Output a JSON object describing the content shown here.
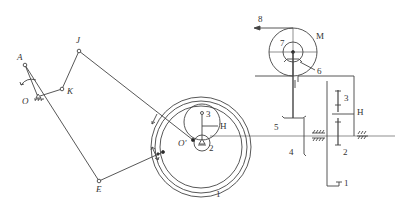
{
  "diagram": {
    "type": "mechanism-kinematic-sketch",
    "colors": {
      "line": "#444444",
      "text": "#333333",
      "background": "#ffffff"
    },
    "labels": {
      "A": "A",
      "O": "O",
      "K": "K",
      "J": "J",
      "E": "E",
      "O_prime": "O'",
      "gear_1": "1",
      "gear_2": "2",
      "gear_3": "3",
      "carrier_H": "H",
      "gear_4": "4",
      "gear_5": "5",
      "part_6": "6",
      "pulley_7": "7",
      "belt_8": "8",
      "motor_M": "M",
      "right_gear_1": "1",
      "right_gear_2": "2",
      "right_gear_3": "3",
      "right_carrier_H": "H",
      "shaft_mark": "I"
    },
    "left_view": {
      "linkage_points": [
        "A",
        "O",
        "K",
        "J",
        "E",
        "O'"
      ],
      "ring_gear": "1",
      "sun_gear": "2",
      "planet_gear": "3",
      "carrier": "H"
    },
    "right_view": {
      "motor": "M",
      "pulley": "7",
      "belt": "8",
      "support": "6",
      "bevel_gears": [
        "4",
        "5"
      ],
      "planetary": [
        "1",
        "2",
        "3",
        "H"
      ]
    }
  }
}
